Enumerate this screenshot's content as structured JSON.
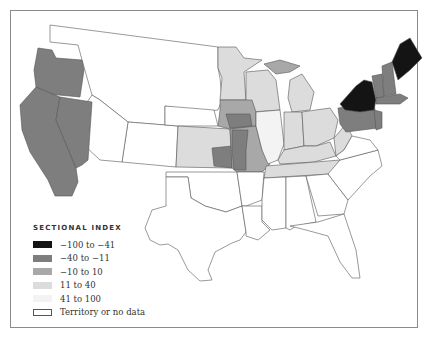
{
  "legend": {
    "title": "SECTIONAL INDEX",
    "items": [
      {
        "label": "−100 to −41",
        "color": "#141414"
      },
      {
        "label": "−40 to −11",
        "color": "#7e7e7e"
      },
      {
        "label": "−10 to 10",
        "color": "#a8a8a8"
      },
      {
        "label": "11 to 40",
        "color": "#dcdcdc"
      },
      {
        "label": "41 to 100",
        "color": "#f3f3f3"
      },
      {
        "label": "Territory or no data",
        "color": "#ffffff"
      }
    ]
  },
  "regions": [
    {
      "name": "washington-territory",
      "category": "Territory or no data"
    },
    {
      "name": "oregon",
      "category": "−40 to −11"
    },
    {
      "name": "california",
      "category": "−40 to −11"
    },
    {
      "name": "nevada",
      "category": "−40 to −11"
    },
    {
      "name": "minnesota",
      "category": "11 to 40"
    },
    {
      "name": "wisconsin",
      "category": "11 to 40"
    },
    {
      "name": "michigan",
      "category": "11 to 40"
    },
    {
      "name": "iowa",
      "category": "−10 to 10"
    },
    {
      "name": "illinois",
      "category": "41 to 100"
    },
    {
      "name": "indiana",
      "category": "11 to 40"
    },
    {
      "name": "ohio",
      "category": "11 to 40"
    },
    {
      "name": "kansas",
      "category": "11 to 40"
    },
    {
      "name": "missouri",
      "category": "−10 to 10"
    },
    {
      "name": "kentucky",
      "category": "11 to 40"
    },
    {
      "name": "tennessee",
      "category": "11 to 40"
    },
    {
      "name": "pennsylvania",
      "category": "−40 to −11"
    },
    {
      "name": "new-york",
      "category": "−100 to −41"
    },
    {
      "name": "vermont",
      "category": "−40 to −11"
    },
    {
      "name": "new-hampshire",
      "category": "−40 to −11"
    },
    {
      "name": "maine",
      "category": "−100 to −41"
    },
    {
      "name": "massachusetts",
      "category": "−40 to −11"
    },
    {
      "name": "new-jersey",
      "category": "−40 to −11"
    },
    {
      "name": "west-virginia",
      "category": "11 to 40"
    },
    {
      "name": "south",
      "category": "Territory or no data"
    }
  ]
}
